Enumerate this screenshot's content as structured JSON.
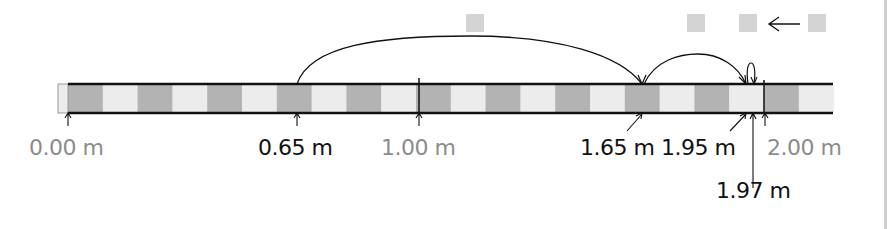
{
  "diagram": {
    "type": "number-line-jumps",
    "unit": "m",
    "bar": {
      "start_m": 0.0,
      "end_m": 2.2,
      "segment_m": 0.1,
      "colors": {
        "dark": "#b3b3b3",
        "light": "#ececec",
        "outline": "#111111"
      }
    },
    "labels": [
      {
        "text": "0.00 m",
        "value": 0.0,
        "style": "gray"
      },
      {
        "text": "0.65 m",
        "value": 0.65,
        "style": "black"
      },
      {
        "text": "1.00 m",
        "value": 1.0,
        "style": "gray"
      },
      {
        "text": "1.65 m",
        "value": 1.65,
        "style": "black"
      },
      {
        "text": "1.95 m",
        "value": 1.95,
        "style": "black"
      },
      {
        "text": "2.00 m",
        "value": 2.0,
        "style": "gray"
      },
      {
        "text": "1.97 m",
        "value": 1.97,
        "style": "black"
      }
    ],
    "jumps": [
      {
        "from": 0.65,
        "to": 1.65,
        "answer_box": "blank"
      },
      {
        "from": 1.65,
        "to": 1.95,
        "answer_box": "blank"
      },
      {
        "from": 1.95,
        "to": 1.97,
        "answer_box": "blank"
      }
    ],
    "answer_boxes": [
      "",
      "",
      "",
      ""
    ],
    "arrow_glyph": "←"
  }
}
